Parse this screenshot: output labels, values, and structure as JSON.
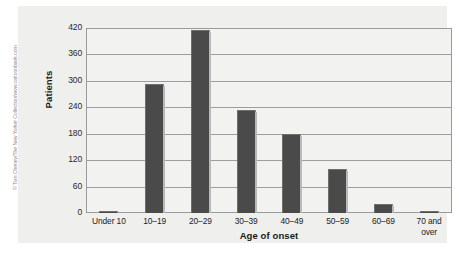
{
  "credit": {
    "text": "© Tom Cheney/The New Yorker Collection/www.cartoonbank.com"
  },
  "colors": {
    "bar_fill": "#4a4a4a",
    "bar_highlight": "#b9b9b9",
    "plot_background": "#f2f2f0",
    "panel_background": "#efefed",
    "gridline": "#9d9d9d",
    "axis": "#9a9a9a",
    "text": "#1a1a1a"
  },
  "chart_data": {
    "type": "bar",
    "title": "",
    "subtitle": "",
    "xlabel": "Age of onset",
    "ylabel": "Patients",
    "categories": [
      "Under 10",
      "10–19",
      "20–29",
      "30–39",
      "40–49",
      "50–59",
      "60–69",
      "70 and over"
    ],
    "values": [
      4,
      292,
      415,
      235,
      180,
      100,
      20,
      4
    ],
    "ylim": [
      0,
      420
    ],
    "yticks": [
      0,
      60,
      120,
      180,
      240,
      300,
      360,
      420
    ],
    "ytick_labels": [
      "0",
      "60",
      "120",
      "180",
      "240",
      "300",
      "360",
      "420"
    ],
    "grid": true,
    "grid_axis": "y",
    "legend": false,
    "legend_position": "none",
    "bar_width_ratio": 0.42,
    "annotations": []
  }
}
